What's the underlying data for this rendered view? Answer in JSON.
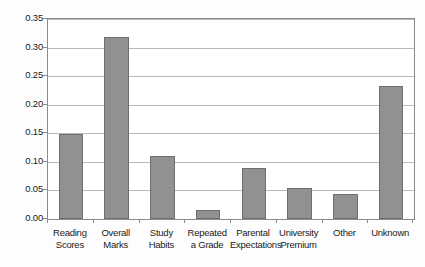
{
  "chart_data": {
    "type": "bar",
    "title": "",
    "subtitle": "",
    "xlabel": "",
    "ylabel": "",
    "ylim": [
      0.0,
      0.35
    ],
    "ytick_values": [
      0.0,
      0.05,
      0.1,
      0.15,
      0.2,
      0.25,
      0.3,
      0.35
    ],
    "ytick_labels": [
      "0.00",
      "0.05",
      "0.10",
      "0.15",
      "0.20",
      "0.25",
      "0.30",
      "0.35"
    ],
    "grid": "horizontal",
    "legend": "none",
    "annotations": [],
    "categories": [
      "Reading Scores",
      "Overall Marks",
      "Study Habits",
      "Repeated a Grade",
      "Parental Expectations",
      "University Premium",
      "Other",
      "Unknown"
    ],
    "category_label_lines": [
      [
        "Reading",
        "Scores"
      ],
      [
        "Overall",
        "Marks"
      ],
      [
        "Study",
        "Habits"
      ],
      [
        "Repeated",
        "a Grade"
      ],
      [
        "Parental",
        "Expectations"
      ],
      [
        "University",
        "Premium"
      ],
      [
        "Other",
        ""
      ],
      [
        "Unknown",
        ""
      ]
    ],
    "values": [
      0.148,
      0.318,
      0.111,
      0.016,
      0.09,
      0.054,
      0.044,
      0.233
    ],
    "bar_color": "#919191",
    "bar_edge_color": "#6f6f6f",
    "grid_color": "#b9b9b9",
    "axis_color": "#8c8c8c",
    "text_color": "#1a1a1a",
    "background_color": "#ffffff"
  }
}
